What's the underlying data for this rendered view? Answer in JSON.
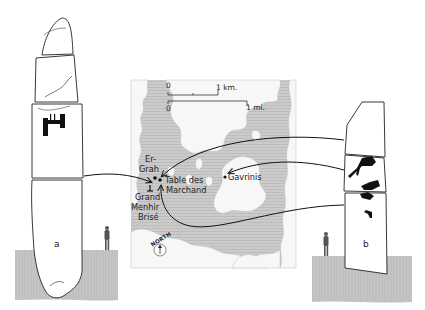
{
  "figure": {
    "type": "illustrated diagram"
  },
  "map": {
    "scale": {
      "km_zero": "0",
      "km_label": "1 km.",
      "mi_zero": "0",
      "mi_label": "1 mi."
    },
    "places": {
      "er_grah_line1": "Er-",
      "er_grah_line2": "Grah",
      "table_line1": "Table des",
      "table_line2": "Marchand",
      "menhir_line1": "Grand",
      "menhir_line2": "Menhir",
      "menhir_line3": "Brisé",
      "gavrinis": "Gavrinis"
    },
    "north_label": "NORTH"
  },
  "stones": {
    "a": {
      "label": "a"
    },
    "b": {
      "label": "b"
    }
  },
  "colors": {
    "land": "#f7f7f7",
    "water": "#c9c9c9",
    "ground": "#c4c4c4",
    "ink": "#111111"
  }
}
